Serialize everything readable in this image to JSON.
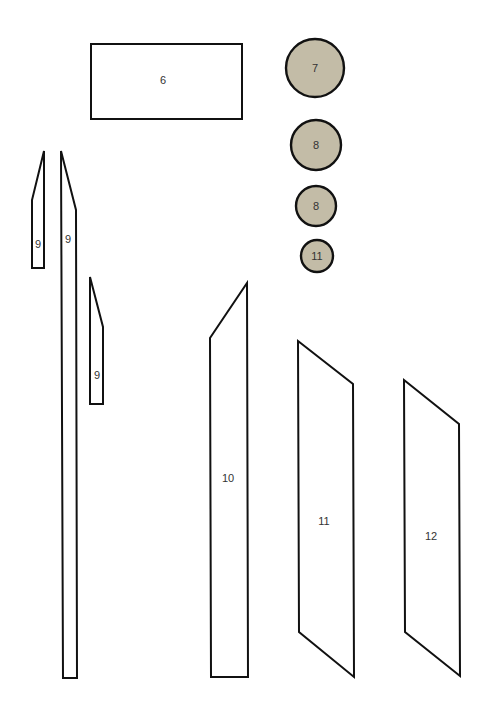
{
  "diagram": {
    "type": "pattern-pieces",
    "circle_fill": "#c3bca7",
    "stroke_color": "#111111",
    "pieces": [
      {
        "id": "piece-6",
        "label": "6",
        "shape": "rectangle"
      },
      {
        "id": "piece-9a",
        "label": "9",
        "shape": "tapered-strip"
      },
      {
        "id": "piece-9b",
        "label": "9",
        "shape": "tapered-strip"
      },
      {
        "id": "piece-9c",
        "label": "9",
        "shape": "tapered-strip"
      },
      {
        "id": "piece-10",
        "label": "10",
        "shape": "trapezoid"
      },
      {
        "id": "piece-11",
        "label": "11",
        "shape": "parallelogram"
      },
      {
        "id": "piece-12",
        "label": "12",
        "shape": "parallelogram"
      }
    ],
    "circles": [
      {
        "id": "circle-7",
        "label": "7"
      },
      {
        "id": "circle-8a",
        "label": "8"
      },
      {
        "id": "circle-8b",
        "label": "8"
      },
      {
        "id": "circle-11",
        "label": "11"
      }
    ]
  }
}
